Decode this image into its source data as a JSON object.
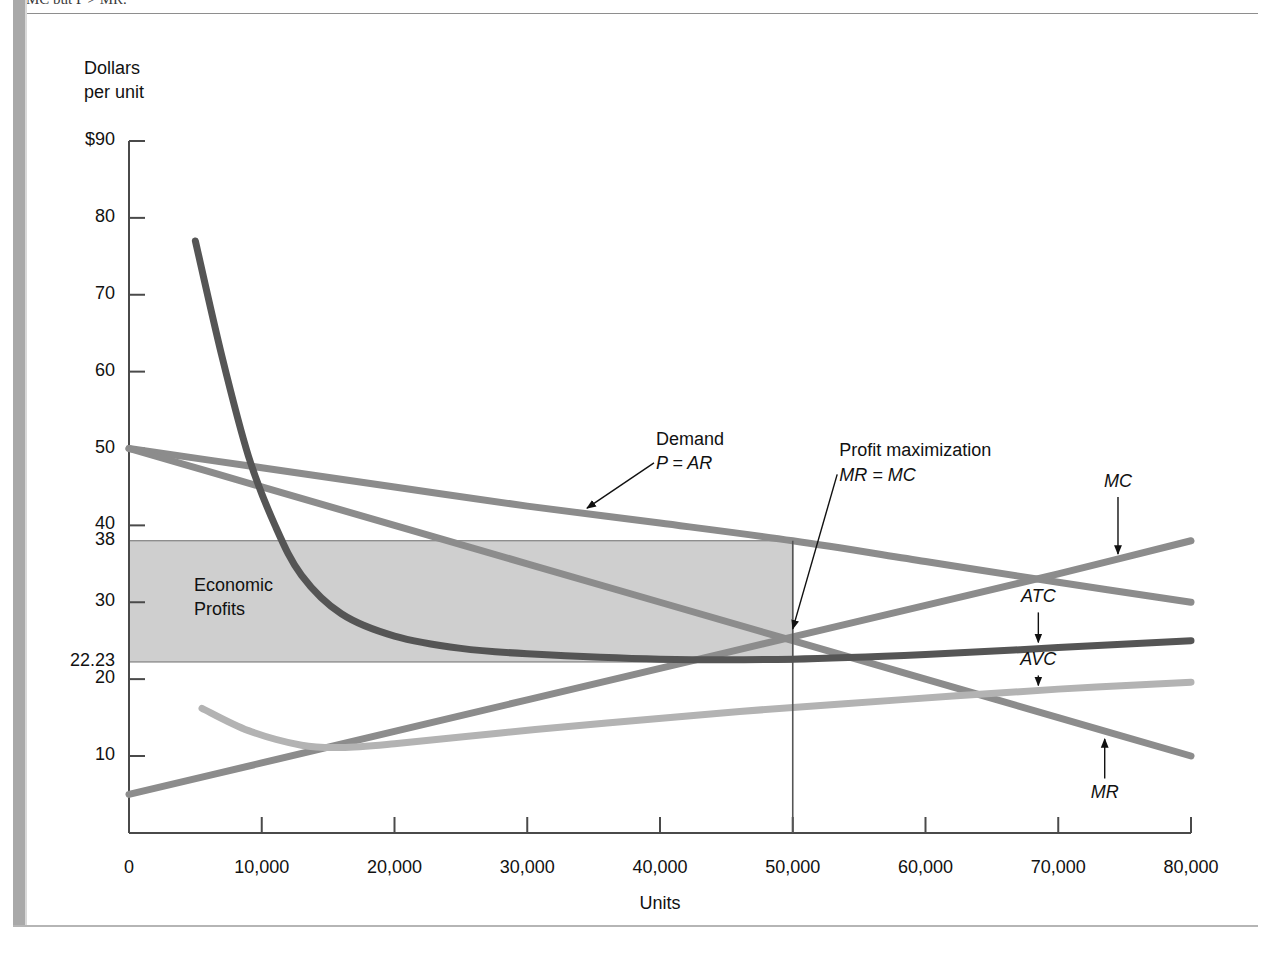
{
  "page": {
    "cutoff_header": "MC but P > MR.",
    "figure_kind": "economics-cost-curve-diagram"
  },
  "chart_data": {
    "type": "line",
    "title": "",
    "subtitle": "",
    "ylabel": "Dollars\nper unit",
    "xlabel": "Units",
    "xlim": [
      0,
      80000
    ],
    "ylim": [
      0,
      90
    ],
    "grid": false,
    "legend_position": "inline-annotations",
    "x_ticks": [
      0,
      10000,
      20000,
      30000,
      40000,
      50000,
      60000,
      70000,
      80000
    ],
    "x_tick_labels": [
      "0",
      "10,000",
      "20,000",
      "30,000",
      "40,000",
      "50,000",
      "60,000",
      "70,000",
      "80,000"
    ],
    "y_ticks": [
      10,
      20,
      30,
      40,
      50,
      60,
      70,
      80,
      90
    ],
    "y_tick_labels": [
      "10",
      "20",
      "30",
      "40",
      "50",
      "60",
      "70",
      "80",
      "$90"
    ],
    "y_extra_ticks": [
      {
        "value": 38,
        "label": "38"
      },
      {
        "value": 22.23,
        "label": "22.23"
      }
    ],
    "series": [
      {
        "name": "Demand",
        "label": "Demand",
        "sublabel": "P = AR",
        "color": "#8c8c8c",
        "width": 7,
        "x": [
          0,
          10000,
          20000,
          30000,
          40000,
          50000,
          60000,
          70000,
          80000
        ],
        "values": [
          50,
          47.5,
          45,
          42.5,
          40.3,
          38,
          35.3,
          32.6,
          30
        ]
      },
      {
        "name": "MR",
        "label": "MR",
        "color": "#8c8c8c",
        "width": 7,
        "x": [
          0,
          10000,
          20000,
          30000,
          40000,
          50000,
          60000,
          70000,
          80000
        ],
        "values": [
          50,
          45,
          40,
          35,
          30,
          25,
          20,
          15,
          10
        ]
      },
      {
        "name": "MC",
        "label": "MC",
        "color": "#8c8c8c",
        "width": 7,
        "x": [
          0,
          10000,
          20000,
          30000,
          40000,
          50000,
          60000,
          70000,
          80000
        ],
        "values": [
          5,
          9.1,
          13.2,
          17.3,
          21.4,
          25.5,
          29.6,
          33.7,
          38
        ]
      },
      {
        "name": "ATC",
        "label": "ATC",
        "color": "#555555",
        "width": 7,
        "x": [
          5000,
          7000,
          9000,
          11000,
          13000,
          16000,
          20000,
          25000,
          30000,
          40000,
          50000,
          60000,
          70000,
          80000
        ],
        "values": [
          77,
          62,
          49,
          40,
          33.5,
          28.5,
          25.6,
          24.0,
          23.3,
          22.6,
          22.6,
          23.2,
          24.1,
          25.0
        ]
      },
      {
        "name": "AVC",
        "label": "AVC",
        "color": "#b3b3b3",
        "width": 7,
        "x": [
          5500,
          9000,
          13000,
          16000,
          20000,
          28000,
          36000,
          46000,
          58000,
          70000,
          80000
        ],
        "values": [
          16.2,
          13.3,
          11.4,
          11.1,
          11.6,
          13.0,
          14.3,
          15.8,
          17.3,
          18.7,
          19.6
        ]
      }
    ],
    "shaded_regions": [
      {
        "name": "Economic Profits",
        "label": "Economic\nProfits",
        "color": "#cfcfcf",
        "x_range": [
          0,
          50000
        ],
        "y_range": [
          22.23,
          38
        ]
      }
    ],
    "annotations": [
      {
        "name": "demand-annotation",
        "text": "Demand",
        "italic_text": "P = AR",
        "point_x": 34500,
        "point_y": 41.2,
        "text_x": 40000,
        "text_y": 51
      },
      {
        "name": "profit-max-annotation",
        "text": "Profit maximization",
        "italic_text": "MR = MC",
        "point_x": 50000,
        "point_y": 25.5,
        "text_x": 53800,
        "text_y": 49.5
      },
      {
        "name": "mc-label",
        "text": "MC",
        "arrow": "down",
        "point_x": 74500,
        "point_y": 35.5,
        "text_x": 74500,
        "text_y": 45.5
      },
      {
        "name": "atc-label",
        "text": "ATC",
        "arrow": "down",
        "point_x": 68500,
        "point_y": 24.0,
        "text_x": 68500,
        "text_y": 30.5
      },
      {
        "name": "avc-label",
        "text": "AVC",
        "arrow": "down",
        "point_x": 68500,
        "point_y": 18.4,
        "text_x": 68500,
        "text_y": 22.3
      },
      {
        "name": "mr-label",
        "text": "MR",
        "arrow": "up",
        "point_x": 73500,
        "point_y": 13.0,
        "text_x": 73500,
        "text_y": 5.0
      }
    ],
    "reference_lines": [
      {
        "name": "profit-max-vertical",
        "orientation": "vertical",
        "x": 50000,
        "y_from": 0,
        "y_to": 38,
        "color": "#555555"
      }
    ]
  }
}
